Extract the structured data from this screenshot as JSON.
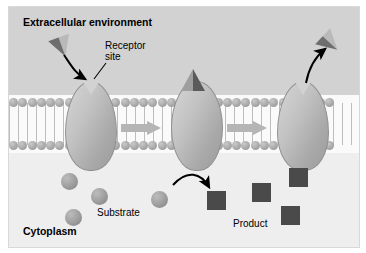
{
  "figure": {
    "labels": {
      "extracellular": "Extracellular environment",
      "cytoplasm": "Cytoplasm",
      "receptor_site": "Receptor\nsite",
      "substrate": "Substrate",
      "product": "Product"
    },
    "colors": {
      "extracellular_bg": "#d2d2d2",
      "cytoplasm_bg": "#eeeeee",
      "membrane_bg": "#fafafa",
      "phospholipid_head": "#a6a6a6",
      "phospholipid_tail": "#bdbdbd",
      "protein_fill": "#c2c2c2",
      "protein_stroke": "#8f8f8f",
      "transition_arrow": "#b5b5b5",
      "substrate_sphere": "#9d9d9d",
      "product_square": "#4a4a4a",
      "triangle_light": "#b9b9b9",
      "triangle_dark": "#6e6e6e",
      "annotation_arrow": "#000000",
      "panel_bg": "#f2f2f2",
      "panel_border": "#d8d8d8",
      "text": "#000000"
    },
    "membrane": {
      "head_count": 35,
      "bilayer": "phospholipid",
      "leaflets": 2
    },
    "stages": [
      {
        "index": 1,
        "name": "binding",
        "description": "Substrate triangle binds the open receptor site of the carrier protein",
        "protein_state": "open"
      },
      {
        "index": 2,
        "name": "transport",
        "description": "Carrier protein closes around the bound substrate and translocates it",
        "protein_state": "closed"
      },
      {
        "index": 3,
        "name": "release",
        "description": "Carrier protein reopens and releases the transported molecule",
        "protein_state": "open"
      }
    ],
    "substrate_spheres": 4,
    "product_squares": 4,
    "annotation_arrows": [
      {
        "name": "binding-arrow",
        "from": "free substrate triangle",
        "to": "receptor site"
      },
      {
        "name": "receptor-pointer",
        "from": "receptor site label",
        "to": "protein notch"
      },
      {
        "name": "conversion-arrow",
        "from": "substrate sphere",
        "to": "product square"
      },
      {
        "name": "release-arrow",
        "from": "protein notch",
        "to": "released triangle"
      }
    ],
    "transition_arrows": 2
  }
}
